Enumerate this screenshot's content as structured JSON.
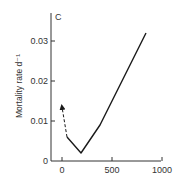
{
  "chart_data": {
    "type": "line",
    "panel_label": "C",
    "title": "",
    "xlabel": "",
    "ylabel": "Mortality rate d⁻¹",
    "xlim": [
      -100,
      1000
    ],
    "ylim": [
      0,
      0.035
    ],
    "x_ticks": [
      0,
      500,
      1000
    ],
    "x_tick_labels": [
      "0",
      "500",
      "1000"
    ],
    "y_ticks": [
      0,
      0.01,
      0.02,
      0.03
    ],
    "y_tick_labels": [
      "0",
      "0.01",
      "0.02",
      "0.03"
    ],
    "grid": false,
    "legend": null,
    "series": [
      {
        "name": "extrapolated (dashed arrow)",
        "style": "dashed-arrow",
        "x": [
          50,
          0
        ],
        "y": [
          0.006,
          0.0135
        ]
      },
      {
        "name": "mortality",
        "style": "solid",
        "x": [
          50,
          190,
          380,
          840
        ],
        "y": [
          0.006,
          0.002,
          0.009,
          0.032
        ]
      }
    ]
  },
  "colors": {
    "line": "#1a1a1a",
    "axis": "#333333",
    "background": "#ffffff"
  }
}
